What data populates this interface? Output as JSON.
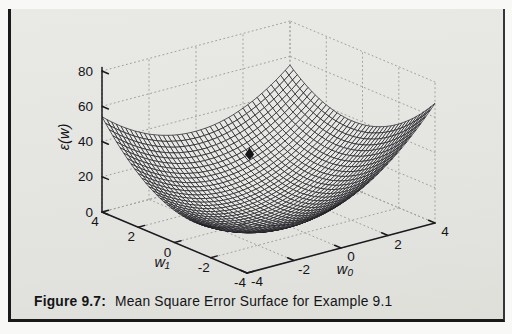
{
  "figure": {
    "caption_prefix": "Figure 9.7:",
    "caption_text": "Mean Square Error Surface for Example 9.1"
  },
  "chart_data": {
    "type": "surface",
    "title": "",
    "xlabel": "w₀",
    "ylabel": "w₁",
    "zlabel": "ε(w)",
    "x_range": [
      -4,
      4
    ],
    "y_range": [
      -4,
      4
    ],
    "z_range": [
      0,
      80
    ],
    "x_ticks": [
      "-4",
      "-2",
      "0",
      "2",
      "4"
    ],
    "y_ticks": [
      "4",
      "2",
      "0",
      "-2",
      "-4"
    ],
    "z_ticks": [
      "0",
      "20",
      "40",
      "60",
      "80"
    ],
    "x_tick_values": [
      -4,
      -2,
      0,
      2,
      4
    ],
    "y_tick_values": [
      4,
      2,
      0,
      -2,
      -4
    ],
    "z_tick_values": [
      0,
      20,
      40,
      60,
      80
    ],
    "grid": "dotted",
    "mesh_divisions": 40,
    "surface": {
      "description": "quadratic MSE bowl: eps(w0,w1) = a*((w0-p)^2+(w1-q)^2) + c*(w0-p)*(w1-q) + m",
      "a": 1.43,
      "c": -0.61,
      "p": -1.0,
      "q": -0.5,
      "m": 4,
      "corner_values_estimated": {
        "w0=-4,w1=4": 54,
        "w0=4,w1=4": 55,
        "w0=4,w1=-4": 68,
        "w0=-4,w1=-4": 28
      }
    },
    "surface_marker": {
      "w0": 1.2,
      "w1": 2.6
    }
  }
}
